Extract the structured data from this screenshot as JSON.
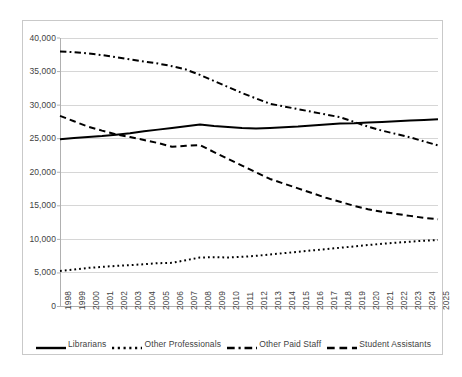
{
  "chart_data": {
    "type": "line",
    "title": "",
    "xlabel": "",
    "ylabel": "",
    "ylim": [
      0,
      40000
    ],
    "grid": true,
    "legend_position": "bottom",
    "y_ticks": [
      "0",
      "5,000",
      "10,000",
      "15,000",
      "20,000",
      "25,000",
      "30,000",
      "35,000",
      "40,000"
    ],
    "y_tick_values": [
      0,
      5000,
      10000,
      15000,
      20000,
      25000,
      30000,
      35000,
      40000
    ],
    "categories": [
      "1998",
      "1999",
      "2000",
      "2001",
      "2002",
      "2003",
      "2004",
      "2005",
      "2006",
      "2007",
      "2008",
      "2009",
      "2010",
      "2011",
      "2012",
      "2013",
      "2014",
      "2015",
      "2016",
      "2017",
      "2018",
      "2019",
      "2020",
      "2021",
      "2022",
      "2023",
      "2024",
      "2025"
    ],
    "series": [
      {
        "name": "Librarians",
        "style": "solid",
        "color": "#000000",
        "values": [
          24900,
          25100,
          25250,
          25400,
          25600,
          25800,
          26100,
          26350,
          26600,
          26850,
          27100,
          26900,
          26750,
          26600,
          26500,
          26600,
          26700,
          26800,
          26950,
          27100,
          27250,
          27300,
          27400,
          27500,
          27600,
          27700,
          27800,
          27900
        ]
      },
      {
        "name": "Other Professionals",
        "style": "dotted",
        "color": "#000000",
        "values": [
          5300,
          5500,
          5750,
          5900,
          6050,
          6150,
          6300,
          6450,
          6500,
          6900,
          7300,
          7350,
          7300,
          7400,
          7550,
          7750,
          7950,
          8150,
          8350,
          8550,
          8750,
          8950,
          9150,
          9350,
          9500,
          9650,
          9800,
          9900
        ]
      },
      {
        "name": "Other Paid Staff",
        "style": "dashdot",
        "color": "#000000",
        "values": [
          38000,
          37900,
          37700,
          37450,
          37150,
          36800,
          36500,
          36200,
          35800,
          35300,
          34500,
          33600,
          32700,
          31800,
          31000,
          30200,
          29800,
          29400,
          29000,
          28600,
          28200,
          27500,
          26800,
          26200,
          25700,
          25200,
          24600,
          24000
        ]
      },
      {
        "name": "Student Assistants",
        "style": "dashed",
        "color": "#000000",
        "values": [
          28400,
          27600,
          26800,
          26200,
          25650,
          25250,
          24800,
          24350,
          23800,
          23950,
          24050,
          23000,
          22000,
          21000,
          20000,
          19000,
          18300,
          17600,
          16900,
          16200,
          15600,
          15000,
          14500,
          14100,
          13800,
          13500,
          13200,
          13000
        ]
      }
    ]
  },
  "legend": {
    "items": [
      {
        "label": "Librarians",
        "style": "solid"
      },
      {
        "label": "Other Professionals",
        "style": "dotted"
      },
      {
        "label": "Other Paid Staff",
        "style": "dashdot"
      },
      {
        "label": "Student Assistants",
        "style": "dashed"
      }
    ]
  }
}
